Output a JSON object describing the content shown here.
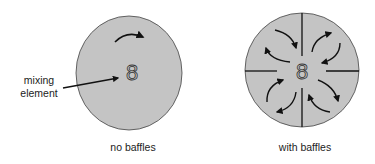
{
  "colors": {
    "fill": "#c4c4c4",
    "stroke": "#333333",
    "arrow": "#111111"
  },
  "left_panel": {
    "caption": "no baffles",
    "callout_line1": "mixing",
    "callout_line2": "element",
    "impeller_glyph": "8"
  },
  "right_panel": {
    "caption": "with baffles",
    "impeller_glyph": "8"
  }
}
